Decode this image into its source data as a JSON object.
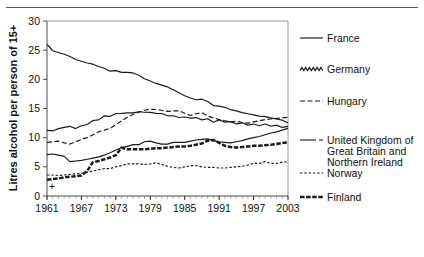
{
  "chart_data": {
    "type": "line",
    "title": "",
    "xlabel": "",
    "ylabel": "Litres alcohol per person of 15+",
    "xlim": [
      1961,
      2003
    ],
    "ylim": [
      0,
      30
    ],
    "yticks": [
      0,
      5,
      10,
      15,
      20,
      25,
      30
    ],
    "xticks": [
      1961,
      1967,
      1973,
      1979,
      1985,
      1991,
      1997,
      2003
    ],
    "xtick_labels": [
      "1961",
      "1967",
      "1973",
      "1979",
      "1985",
      "1991",
      "1997",
      "2003"
    ],
    "ytick_labels": [
      "0",
      "5",
      "10",
      "15",
      "20",
      "25",
      "30"
    ],
    "grid": false,
    "legend_position": "right",
    "minor_xticks": true,
    "annotation_plus": "+",
    "x": [
      1961,
      1962,
      1963,
      1964,
      1965,
      1966,
      1967,
      1968,
      1969,
      1970,
      1971,
      1972,
      1973,
      1974,
      1975,
      1976,
      1977,
      1978,
      1979,
      1980,
      1981,
      1982,
      1983,
      1984,
      1985,
      1986,
      1987,
      1988,
      1989,
      1990,
      1991,
      1992,
      1993,
      1994,
      1995,
      1996,
      1997,
      1998,
      1999,
      2000,
      2001,
      2002,
      2003
    ],
    "series": [
      {
        "name": "France",
        "style": "solid",
        "values": [
          26.0,
          24.9,
          24.6,
          24.3,
          23.9,
          23.4,
          23.1,
          22.8,
          22.6,
          22.2,
          21.9,
          21.4,
          21.5,
          21.2,
          21.2,
          21.1,
          20.7,
          20.1,
          19.7,
          19.3,
          19.0,
          18.7,
          18.2,
          17.7,
          17.2,
          16.8,
          16.5,
          16.6,
          16.2,
          15.5,
          15.4,
          15.2,
          14.8,
          14.6,
          14.3,
          14.1,
          13.9,
          13.7,
          13.6,
          13.4,
          13.2,
          13.0,
          12.5
        ]
      },
      {
        "name": "Germany",
        "style": "wavy",
        "values": [
          11.1,
          11.3,
          11.4,
          11.9,
          11.8,
          11.7,
          11.9,
          12.4,
          12.8,
          13.2,
          13.6,
          13.8,
          14.0,
          14.3,
          14.1,
          14.4,
          14.3,
          14.5,
          14.2,
          14.3,
          14.0,
          13.9,
          13.6,
          13.6,
          13.4,
          13.5,
          13.3,
          13.2,
          13.1,
          12.8,
          12.9,
          12.8,
          12.6,
          12.5,
          12.4,
          12.3,
          12.2,
          12.2,
          12.2,
          12.1,
          12.0,
          11.9,
          11.8
        ]
      },
      {
        "name": "Hungary",
        "style": "longdash",
        "values": [
          9.2,
          9.3,
          9.4,
          9.1,
          8.9,
          9.3,
          9.7,
          10.0,
          10.5,
          11.0,
          11.3,
          11.6,
          12.2,
          12.9,
          13.5,
          14.0,
          14.4,
          14.7,
          14.9,
          14.8,
          14.7,
          14.5,
          14.6,
          14.6,
          14.2,
          13.8,
          14.1,
          14.3,
          13.7,
          13.4,
          13.1,
          12.9,
          12.7,
          12.8,
          12.6,
          12.5,
          12.7,
          12.9,
          13.1,
          13.2,
          13.3,
          13.4,
          13.5
        ]
      },
      {
        "name": "United Kingdom of Great Britain and Northern Ireland",
        "style": "solid-dash",
        "values": [
          7.1,
          7.2,
          7.0,
          6.8,
          5.9,
          6.0,
          6.1,
          6.3,
          6.5,
          6.7,
          7.0,
          7.4,
          7.9,
          8.3,
          8.5,
          8.8,
          8.8,
          9.3,
          9.4,
          9.1,
          8.9,
          8.9,
          9.2,
          9.2,
          9.2,
          9.4,
          9.6,
          9.7,
          9.8,
          9.5,
          9.3,
          9.2,
          9.1,
          9.3,
          9.5,
          9.8,
          10.0,
          10.2,
          10.5,
          10.8,
          11.0,
          11.3,
          11.6
        ]
      },
      {
        "name": "Norway",
        "style": "shortdash",
        "values": [
          3.6,
          3.6,
          3.5,
          3.6,
          3.7,
          3.8,
          3.9,
          4.1,
          4.3,
          4.5,
          4.7,
          4.7,
          5.0,
          5.2,
          5.5,
          5.5,
          5.5,
          5.4,
          5.5,
          5.7,
          5.4,
          5.1,
          4.9,
          4.8,
          5.0,
          5.2,
          5.2,
          5.0,
          4.9,
          4.9,
          4.8,
          4.8,
          4.9,
          5.0,
          5.1,
          5.3,
          5.6,
          5.6,
          5.9,
          5.6,
          5.6,
          5.8,
          5.9
        ]
      },
      {
        "name": "Finland",
        "style": "thick-dash",
        "values": [
          2.8,
          2.9,
          3.0,
          3.2,
          3.3,
          3.4,
          3.5,
          4.3,
          5.8,
          6.0,
          6.3,
          6.6,
          7.0,
          8.3,
          8.0,
          8.0,
          8.0,
          8.0,
          8.1,
          8.2,
          8.2,
          8.3,
          8.4,
          8.5,
          8.5,
          8.6,
          8.8,
          9.0,
          9.5,
          9.6,
          9.1,
          8.6,
          8.4,
          8.3,
          8.4,
          8.5,
          8.6,
          8.6,
          8.7,
          8.8,
          8.9,
          9.1,
          9.2
        ]
      }
    ],
    "legend": [
      {
        "label": "France",
        "style": "solid"
      },
      {
        "label": "Germany",
        "style": "wavy"
      },
      {
        "label": "Hungary",
        "style": "longdash"
      },
      {
        "label": "United Kingdom of",
        "style": "solid-dash"
      },
      {
        "label": "Great Britain and",
        "style": "none"
      },
      {
        "label": "Northern Ireland",
        "style": "none"
      },
      {
        "label": "Norway",
        "style": "shortdash"
      },
      {
        "label": "Finland",
        "style": "thick-dash"
      }
    ]
  }
}
